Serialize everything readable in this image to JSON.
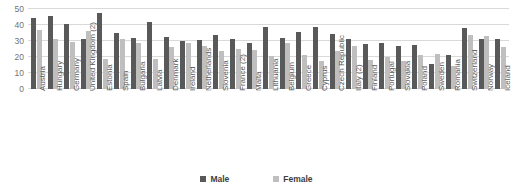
{
  "chart_data": {
    "type": "bar",
    "title": "",
    "xlabel": "",
    "ylabel": "",
    "ylim": [
      0,
      50
    ],
    "yticks": [
      0,
      10,
      20,
      30,
      40,
      50
    ],
    "grid": true,
    "legend_position": "bottom",
    "categories": [
      "Austria",
      "Hungary",
      "Germany",
      "United Kingdom (2)",
      "Estonia",
      "Spain",
      "Bulgaria",
      "Latvia",
      "Denmark",
      "Ireland",
      "Netherlands",
      "Slovenia",
      "France (2)",
      "Malta",
      "Lithuania",
      "Belgium",
      "Greece",
      "Cyprus",
      "Czech Republic",
      "Italy (2)",
      "Finland",
      "Portugal",
      "Slovakia",
      "Poland",
      "Sweden",
      "Romania",
      "Switzerland",
      "Norway",
      "Iceland"
    ],
    "series": [
      {
        "name": "Male",
        "color": "#595959",
        "values": [
          44.5,
          45.5,
          40.5,
          31.5,
          47.5,
          35.0,
          32.0,
          42.0,
          32.5,
          30.0,
          30.5,
          34.0,
          31.5,
          29.0,
          38.5,
          32.0,
          35.5,
          39.0,
          34.5,
          31.0,
          28.0,
          29.0,
          27.0,
          27.5,
          15.5,
          21.5,
          38.0,
          31.0,
          31.0
        ]
      },
      {
        "name": "Female",
        "color": "#bfbfbf",
        "values": [
          37.0,
          31.0,
          29.5,
          36.0,
          19.0,
          31.0,
          28.5,
          18.5,
          26.5,
          28.5,
          27.0,
          23.5,
          25.0,
          24.5,
          20.5,
          28.5,
          21.5,
          17.5,
          24.0,
          27.0,
          18.0,
          20.0,
          17.5,
          21.5,
          22.0,
          14.5,
          34.0,
          33.0,
          26.0
        ]
      }
    ]
  },
  "legend": {
    "male_label": "Male",
    "female_label": "Female"
  },
  "colors": {
    "male": "#595959",
    "female": "#bfbfbf",
    "gridline": "#d9d9d9",
    "tick_text": "#737373"
  }
}
